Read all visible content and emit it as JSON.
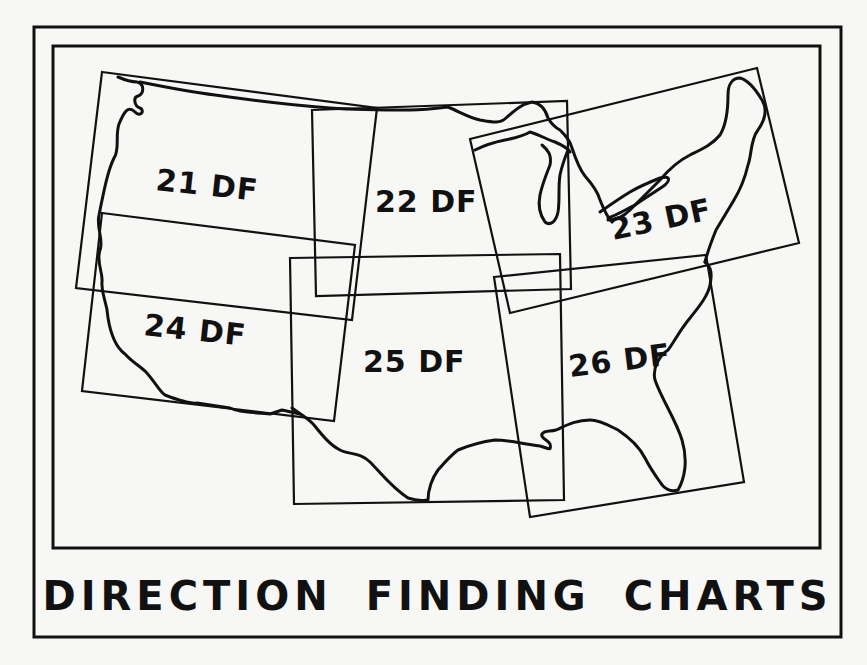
{
  "title": "DIRECTION FINDING CHARTS",
  "frame": {
    "outer": {
      "x": 34,
      "y": 27,
      "w": 807,
      "h": 610
    },
    "inner": {
      "x": 53,
      "y": 46,
      "w": 767,
      "h": 502
    }
  },
  "colors": {
    "paper": "#f7f7f5",
    "ink": "#111111"
  },
  "charts": [
    {
      "id": "21",
      "label": "21 DF",
      "points": "102,72 377,108 352,320 76,288",
      "label_x": 155,
      "label_y": 190,
      "rotate": 6
    },
    {
      "id": "22",
      "label": "22 DF",
      "points": "312,110 567,101 571,289 316,296",
      "label_x": 375,
      "label_y": 212,
      "rotate": 0
    },
    {
      "id": "23",
      "label": "23 DF",
      "points": "470,139 757,68 799,243 510,313",
      "label_x": 613,
      "label_y": 240,
      "rotate": -12
    },
    {
      "id": "24",
      "label": "24 DF",
      "points": "102,213 355,245 334,421 82,391",
      "label_x": 143,
      "label_y": 335,
      "rotate": 6
    },
    {
      "id": "25",
      "label": "25 DF",
      "points": "290,258 560,254 564,500 294,504",
      "label_x": 363,
      "label_y": 372,
      "rotate": 0
    },
    {
      "id": "26",
      "label": "26 DF",
      "points": "494,277 706,255 744,482 530,517",
      "label_x": 570,
      "label_y": 377,
      "rotate": -7
    }
  ],
  "coastlines": [
    {
      "name": "pacific-coast",
      "d": "M118,77 C125,80 132,82 137,82 C145,84 144,94 138,96 C133,97 134,106 140,108 C145,110 141,118 135,112 C128,105 124,112 119,124 C115,135 120,150 114,158 C108,170 104,190 99,215 C96,228 104,240 100,250 C96,262 103,272 102,282 C101,296 107,300 108,318 C110,330 114,346 125,354 C132,362 140,366 146,372 C155,382 160,392 165,395 C178,400 192,404 197,403 L230,408 C242,414 258,412 270,414 L282,410 L300,414"
    },
    {
      "name": "northern-border",
      "d": "M140,82 C160,86 190,92 215,95 C250,100 290,105 330,108 C360,110 380,110 410,110 C420,110 440,108 448,107"
    },
    {
      "name": "gulf-coast",
      "d": "M292,408 C300,414 308,418 314,425 C322,435 330,445 340,450 C350,455 360,452 370,462 C380,472 392,488 408,498 C420,502 425,500 428,500 C428,490 432,478 438,470 C445,462 450,456 458,450 C470,445 480,442 495,440 C510,440 522,444 540,446 C548,448 552,452 550,444 C548,440 540,438 542,434 C545,430 550,432 556,430 C565,426 575,420 590,420 C600,420 610,426 618,430 C630,438 640,448 645,458 C650,468 655,475 660,482 C665,490 672,492 678,490 C685,478 688,460 682,440 C676,420 662,400 655,380 C652,368 660,355 668,350 C674,342 680,330 690,318 C698,308 708,296 710,285 C712,275 712,268 705,262"
    },
    {
      "name": "atlantic-coast",
      "d": "M705,262 C708,250 712,240 716,230 C722,220 728,210 734,200 C740,190 745,178 748,165 C752,155 750,140 758,130 C765,120 768,110 762,100 C756,90 748,80 740,78 C732,78 728,85 728,95 C728,110 726,125 720,135 C712,145 700,150 690,155 C680,160 670,168 660,180 C650,190 640,200 630,210 C622,218 615,220 608,220"
    },
    {
      "name": "great-lakes-north",
      "d": "M448,107 C460,112 470,118 480,120 C492,122 500,124 506,118 C515,110 522,104 532,102 C540,103 545,108 548,118 C552,125 556,128 560,130 C565,135 570,140 572,148 C576,160 580,170 585,176 C592,184 598,192 600,200 C604,210 608,218 612,222"
    },
    {
      "name": "lake-michigan",
      "d": "M542,145 C548,150 552,155 550,165 C546,175 542,185 540,195 C538,205 540,215 545,222 C550,226 556,222 558,212 C560,200 558,188 560,175 C562,165 566,155 568,150"
    },
    {
      "name": "lake-superior",
      "d": "M475,150 C485,145 495,142 505,140 C515,138 525,135 530,132 C540,135 548,140 555,142 C562,145 568,148 570,152"
    },
    {
      "name": "lake-erie-ontario",
      "d": "M600,212 C610,205 620,198 630,192 C640,186 650,182 660,178 C668,176 672,178 665,185 C655,192 645,198 635,205 C625,210 615,216 608,218"
    }
  ]
}
